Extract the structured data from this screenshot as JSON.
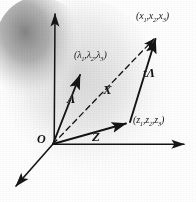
{
  "figure": {
    "background_color": "#ffffff",
    "ink_color": "#141414",
    "shading": {
      "blob_color": "#8c8c8c",
      "halo_color": "#d8d8d8"
    }
  },
  "labels": {
    "origin": "O",
    "lambda_vector": "Λ",
    "x_vector": "X",
    "z_vector": "Z",
    "t_lambda_vector": "tΛ",
    "lambda_point_open": "(",
    "lambda_point_close": ")",
    "x_point": "(x₁,x₂,x₃)",
    "lambda_point": "(λ₁,λ₂,λ₃)",
    "z_point": "(z₁,z₂,z₃)"
  },
  "points": {
    "x_point_parts": {
      "l": "(",
      "a": "x",
      "a_sub": "1",
      "b": "x",
      "b_sub": "2",
      "c": "x",
      "c_sub": "3",
      "r": ")"
    },
    "lambda_point_parts": {
      "l": "(",
      "a": "λ",
      "a_sub": "1",
      "b": "λ",
      "b_sub": "2",
      "c": "λ",
      "c_sub": "3",
      "r": ")"
    },
    "z_point_parts": {
      "l": "(",
      "a": "z",
      "a_sub": "1",
      "b": "z",
      "b_sub": "2",
      "c": "z",
      "c_sub": "3",
      "r": ")"
    }
  },
  "geometry": {
    "origin_xy": [
      53,
      144
    ],
    "axis_vertical_tip": [
      55,
      9
    ],
    "axis_horizontal_tip": [
      190,
      144
    ],
    "axis_diagonal_tip": [
      11,
      191
    ],
    "lambda_tip": [
      83,
      69
    ],
    "z_tip": [
      130,
      122
    ],
    "x_tip": [
      158,
      31
    ],
    "t_lambda_from": [
      130,
      122
    ],
    "t_lambda_to": [
      158,
      31
    ]
  }
}
